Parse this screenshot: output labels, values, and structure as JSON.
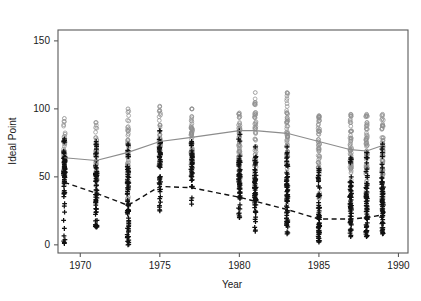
{
  "chart_data": {
    "type": "scatter",
    "title": "",
    "subtitle": "",
    "xlabel": "Year",
    "ylabel": "Ideal Point",
    "xlim": [
      1968.6,
      1990.6
    ],
    "ylim": [
      -6,
      158
    ],
    "xticks": [
      1970,
      1975,
      1980,
      1985,
      1990
    ],
    "xticklabels": [
      "1970",
      "1975",
      "1980",
      "1985",
      "1990"
    ],
    "yticks": [
      0,
      50,
      100,
      150
    ],
    "yticklabels": [
      "0",
      "50",
      "100",
      "150"
    ],
    "grid": false,
    "legend": "none",
    "background": "#ffffff",
    "box_frame": true,
    "series": [
      {
        "name": "upper-group-points",
        "marker": "circle-open",
        "color": "#909090",
        "description": "Gray open circles, upper cloud of ideal points",
        "columns": [
          {
            "x": 1969,
            "low": 44,
            "high": 93,
            "dense_low": 52,
            "dense_high": 78,
            "n": 52
          },
          {
            "x": 1971,
            "low": 40,
            "high": 90,
            "dense_low": 50,
            "dense_high": 78,
            "n": 50
          },
          {
            "x": 1973,
            "low": 34,
            "high": 100,
            "dense_low": 52,
            "dense_high": 86,
            "n": 56
          },
          {
            "x": 1975,
            "low": 58,
            "high": 102,
            "dense_low": 66,
            "dense_high": 92,
            "n": 48
          },
          {
            "x": 1977,
            "low": 50,
            "high": 100,
            "dense_low": 62,
            "dense_high": 92,
            "n": 50
          },
          {
            "x": 1980,
            "low": 44,
            "high": 97,
            "dense_low": 58,
            "dense_high": 88,
            "n": 56
          },
          {
            "x": 1981,
            "low": 36,
            "high": 112,
            "dense_low": 58,
            "dense_high": 100,
            "n": 60
          },
          {
            "x": 1983,
            "low": 30,
            "high": 112,
            "dense_low": 56,
            "dense_high": 100,
            "n": 62
          },
          {
            "x": 1985,
            "low": 34,
            "high": 95,
            "dense_low": 54,
            "dense_high": 90,
            "n": 58
          },
          {
            "x": 1987,
            "low": 30,
            "high": 96,
            "dense_low": 52,
            "dense_high": 90,
            "n": 60
          },
          {
            "x": 1988,
            "low": 30,
            "high": 96,
            "dense_low": 52,
            "dense_high": 90,
            "n": 60
          },
          {
            "x": 1989,
            "low": 28,
            "high": 96,
            "dense_low": 50,
            "dense_high": 90,
            "n": 60
          }
        ],
        "trend": {
          "style": "solid",
          "color": "#8c8c8c",
          "points": [
            {
              "x": 1969,
              "y": 64
            },
            {
              "x": 1971,
              "y": 62
            },
            {
              "x": 1973,
              "y": 68
            },
            {
              "x": 1975,
              "y": 76
            },
            {
              "x": 1977,
              "y": 79
            },
            {
              "x": 1980,
              "y": 84
            },
            {
              "x": 1981,
              "y": 84
            },
            {
              "x": 1983,
              "y": 82
            },
            {
              "x": 1985,
              "y": 76
            },
            {
              "x": 1987,
              "y": 70
            },
            {
              "x": 1988,
              "y": 69
            },
            {
              "x": 1989,
              "y": 73
            }
          ]
        }
      },
      {
        "name": "lower-group-points",
        "marker": "plus",
        "color": "#111111",
        "description": "Black plus symbols, lower cloud of ideal points",
        "columns": [
          {
            "x": 1969,
            "low": 1,
            "high": 78,
            "dense_low": 34,
            "dense_high": 68,
            "n": 64
          },
          {
            "x": 1971,
            "low": 13,
            "high": 76,
            "dense_low": 22,
            "dense_high": 62,
            "n": 58
          },
          {
            "x": 1973,
            "low": 0,
            "high": 74,
            "dense_low": 8,
            "dense_high": 56,
            "n": 66
          },
          {
            "x": 1975,
            "low": 25,
            "high": 84,
            "dense_low": 36,
            "dense_high": 72,
            "n": 44
          },
          {
            "x": 1977,
            "low": 30,
            "high": 76,
            "dense_low": 40,
            "dense_high": 68,
            "n": 38
          },
          {
            "x": 1980,
            "low": 20,
            "high": 84,
            "dense_low": 30,
            "dense_high": 62,
            "n": 58
          },
          {
            "x": 1981,
            "low": 10,
            "high": 72,
            "dense_low": 18,
            "dense_high": 56,
            "n": 58
          },
          {
            "x": 1983,
            "low": 8,
            "high": 72,
            "dense_low": 16,
            "dense_high": 52,
            "n": 58
          },
          {
            "x": 1985,
            "low": 2,
            "high": 56,
            "dense_low": 8,
            "dense_high": 40,
            "n": 60
          },
          {
            "x": 1987,
            "low": 6,
            "high": 64,
            "dense_low": 12,
            "dense_high": 44,
            "n": 56
          },
          {
            "x": 1988,
            "low": 6,
            "high": 68,
            "dense_low": 12,
            "dense_high": 46,
            "n": 58
          },
          {
            "x": 1989,
            "low": 8,
            "high": 74,
            "dense_low": 14,
            "dense_high": 48,
            "n": 58
          }
        ],
        "trend": {
          "style": "dashed",
          "color": "#111111",
          "points": [
            {
              "x": 1969,
              "y": 46
            },
            {
              "x": 1971,
              "y": 38
            },
            {
              "x": 1973,
              "y": 29
            },
            {
              "x": 1975,
              "y": 43
            },
            {
              "x": 1977,
              "y": 42
            },
            {
              "x": 1980,
              "y": 35
            },
            {
              "x": 1981,
              "y": 32
            },
            {
              "x": 1983,
              "y": 26
            },
            {
              "x": 1985,
              "y": 19
            },
            {
              "x": 1987,
              "y": 19
            },
            {
              "x": 1988,
              "y": 20
            },
            {
              "x": 1989,
              "y": 22
            }
          ]
        }
      }
    ]
  }
}
